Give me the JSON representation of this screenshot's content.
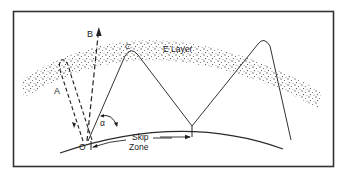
{
  "diagram": {
    "labels": {
      "layer": "E Layer",
      "ray_a": "A",
      "ray_b": "B",
      "ray_c": "C",
      "origin": "O",
      "angle": "α",
      "skip_line1": "Skip",
      "skip_line2": "Zone"
    },
    "colors": {
      "background": "#ffffff",
      "line": "#2a2a2a",
      "frame": "#333333",
      "dots": "#555555"
    }
  }
}
